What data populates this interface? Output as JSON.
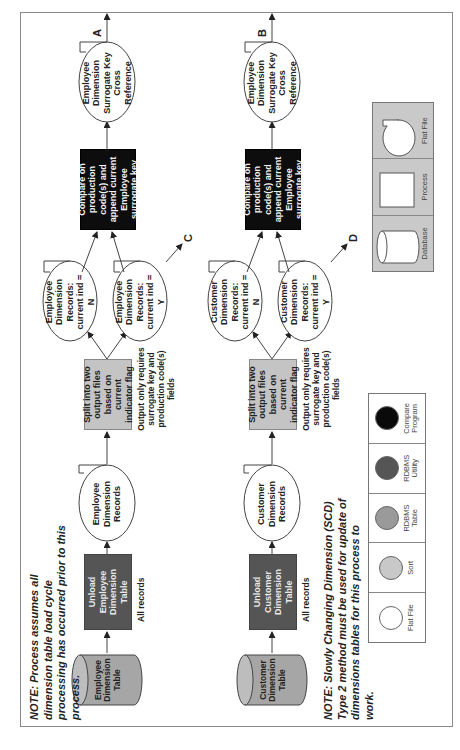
{
  "orientation": "rotated-90-ccw",
  "rows": [
    {
      "id": "employee",
      "source_table": "Employee Dimension Table",
      "unload": "Unload Employee Dimension Table",
      "unload_note": "All records",
      "records_file": "Employee Dimension Records",
      "split": "Split into two output files based on current indicator flag",
      "split_note": "Output only requires surrogate key and production code(s) fields",
      "file_n": "Employee Dimension Records: current ind = N",
      "file_y": "Employee Dimension Records: current ind = Y",
      "file_y_connector": "C",
      "compare": "Compare on production code(s) and append current Employee surrogate key",
      "output": "Employee Dimension Surrogate Key Cross Reference",
      "output_connector": "A"
    },
    {
      "id": "customer",
      "source_table": "Customer Dimension Table",
      "unload": "Unload Customer Dimension Table",
      "unload_note": "All records",
      "records_file": "Customer Dimension Records",
      "split": "Split into two output files based on current indicator flag",
      "split_note": "Output only requires surrogate key and production code(s) fields",
      "file_n": "Customer Dimension Records: current ind = N",
      "file_y": "Customer Dimension Records: current ind = Y",
      "file_y_connector": "D",
      "compare": "Compare on production code(s) and append current Employee surrogate key",
      "output": "Employee Dimension Surrogate Key Cross Reference",
      "output_connector": "B"
    }
  ],
  "notes": {
    "top": "NOTE: Process assumes all dimension table load cycle processing has occurred prior to this process.",
    "bottom": "NOTE: Slowly Changing Dimension (SCD) Type 2 method must be used for update of dimensions tables for this process to work."
  },
  "legend_colors": {
    "title": "Color legend",
    "items": [
      {
        "label": "Flat File",
        "color": "#ffffff"
      },
      {
        "label": "Sort",
        "color": "#c8c8c8"
      },
      {
        "label": "RDBMS Table",
        "color": "#9a9a9a"
      },
      {
        "label": "RDBMS Utility",
        "color": "#555555"
      },
      {
        "label": "Compare Program",
        "color": "#0a0a0a"
      }
    ]
  },
  "legend_shapes": {
    "title": "Shape legend",
    "items": [
      {
        "label": "Database",
        "shape": "cylinder"
      },
      {
        "label": "Process",
        "shape": "rectangle"
      },
      {
        "label": "Flat File",
        "shape": "file-ellipse"
      }
    ]
  }
}
